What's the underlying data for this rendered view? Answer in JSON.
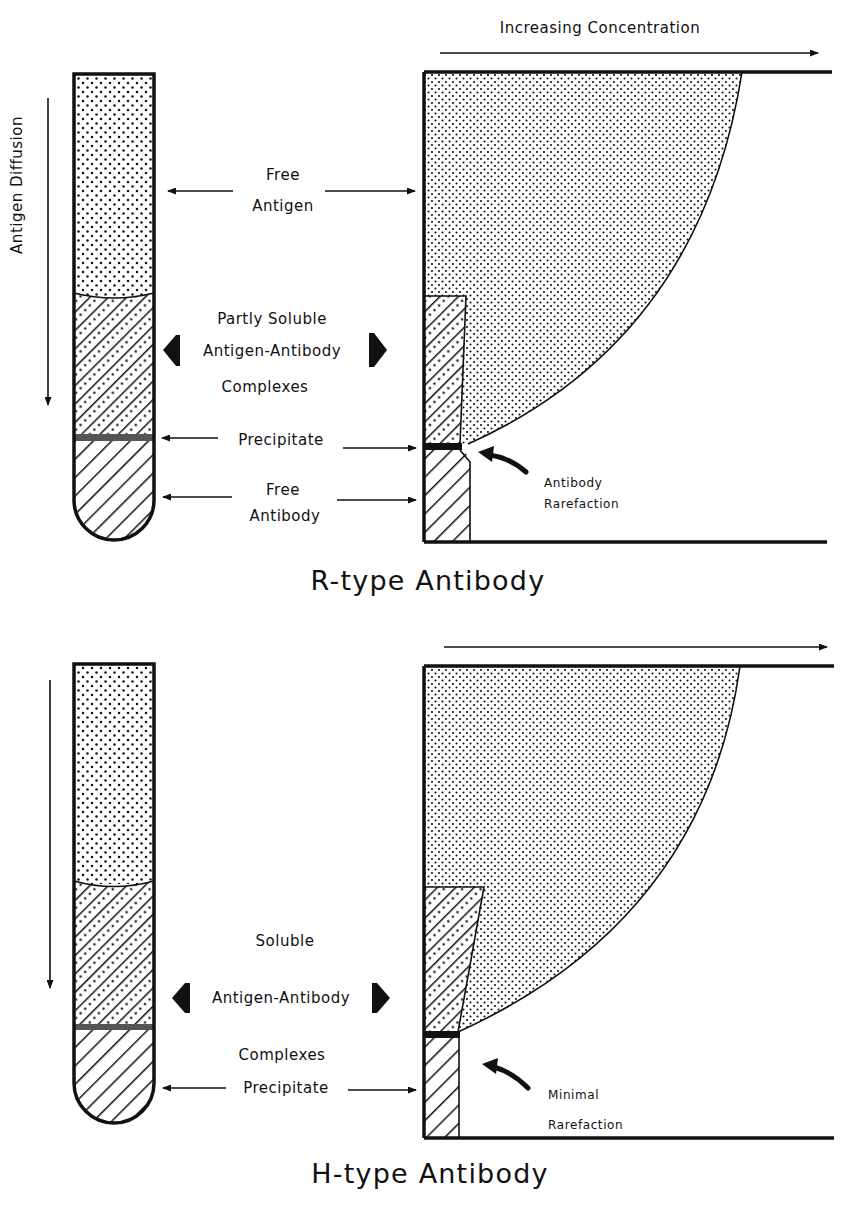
{
  "figure": {
    "top_axis_label": "Increasing Concentration",
    "side_axis_label": "Antigen Diffusion",
    "panels": [
      {
        "id": "r-type",
        "title": "R-type Antibody",
        "labels": {
          "free_antigen_1": "Free",
          "free_antigen_2": "Antigen",
          "complex_1": "Partly Soluble",
          "complex_2": "Antigen-Antibody",
          "complex_3": "Complexes",
          "precipitate": "Precipitate",
          "free_antibody_1": "Free",
          "free_antibody_2": "Antibody",
          "annotation_1": "Antibody",
          "annotation_2": "Rarefaction"
        }
      },
      {
        "id": "h-type",
        "title": "H-type Antibody",
        "labels": {
          "complex_1": "Soluble",
          "complex_2": "Antigen-Antibody",
          "complex_3": "Complexes",
          "precipitate": "Precipitate",
          "annotation_1": "Minimal",
          "annotation_2": "Rarefaction"
        }
      }
    ],
    "colors": {
      "ink": "#111111",
      "paper": "#ffffff"
    }
  }
}
